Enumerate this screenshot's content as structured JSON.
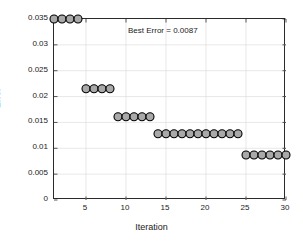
{
  "chart_data": {
    "type": "scatter",
    "title": "",
    "xlabel": "Iteration",
    "ylabel": "Error",
    "xlim": [
      1,
      30
    ],
    "ylim": [
      0,
      0.035
    ],
    "grid": true,
    "legend": null,
    "annotations": [
      {
        "text": "Best Error = 0.0087",
        "x": 16,
        "y": 0.0325
      }
    ],
    "xticks": [
      5,
      10,
      15,
      20,
      25,
      30
    ],
    "xtick_labels": [
      "5",
      "10",
      "15",
      "20",
      "25",
      "30"
    ],
    "yticks": [
      0,
      0.005,
      0.01,
      0.015,
      0.02,
      0.025,
      0.03,
      0.035
    ],
    "ytick_labels": [
      "0",
      "0.005",
      "0.01",
      "0.015",
      "0.02",
      "0.025",
      "0.03",
      "0.035"
    ],
    "marker": {
      "shape": "circle",
      "fill": "#a9a9a9",
      "edge": "#000000",
      "size": 5.2
    },
    "series": [
      {
        "name": "Best Error per Iteration",
        "x": [
          1,
          2,
          3,
          4,
          5,
          6,
          7,
          8,
          9,
          10,
          11,
          12,
          13,
          14,
          15,
          16,
          17,
          18,
          19,
          20,
          21,
          22,
          23,
          24,
          25,
          26,
          27,
          28,
          29,
          30
        ],
        "y": [
          0.035,
          0.035,
          0.035,
          0.035,
          0.0215,
          0.0215,
          0.0215,
          0.0215,
          0.0161,
          0.0161,
          0.0161,
          0.0161,
          0.0161,
          0.0128,
          0.0128,
          0.0128,
          0.0128,
          0.0128,
          0.0128,
          0.0128,
          0.0128,
          0.0128,
          0.0128,
          0.0128,
          0.0087,
          0.0087,
          0.0087,
          0.0087,
          0.0087,
          0.0087
        ]
      }
    ]
  },
  "axes": {
    "x_title": "Iteration",
    "y_title": "Error"
  },
  "annotation_text": "Best Error = 0.0087"
}
